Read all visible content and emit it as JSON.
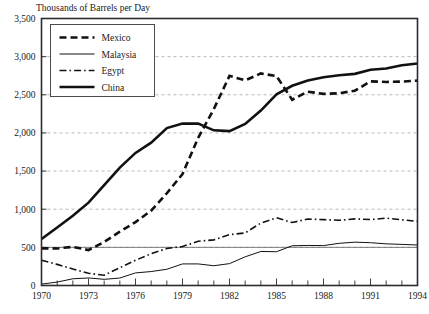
{
  "chart_data": {
    "type": "line",
    "title": "Thousands of Barrels per Day",
    "xlabel": "",
    "ylabel": "",
    "xlim": [
      1970,
      1994
    ],
    "ylim": [
      0,
      3500
    ],
    "ytick_step": 500,
    "ytick_labels": [
      "0",
      "500",
      "1,000",
      "1,500",
      "2,000",
      "2,500",
      "3,000",
      "3,500"
    ],
    "ytick_values": [
      0,
      500,
      1000,
      1500,
      2000,
      2500,
      3000,
      3500
    ],
    "xtick_labels": [
      "1970",
      "1973",
      "1976",
      "1979",
      "1982",
      "1985",
      "1988",
      "1991",
      "1994"
    ],
    "xtick_values": [
      1970,
      1973,
      1976,
      1979,
      1982,
      1985,
      1988,
      1991,
      1994
    ],
    "xminor_step": 1,
    "grid": true,
    "legend_position": "top-left",
    "x": [
      1970,
      1971,
      1972,
      1973,
      1974,
      1975,
      1976,
      1977,
      1978,
      1979,
      1980,
      1981,
      1982,
      1983,
      1984,
      1985,
      1986,
      1987,
      1988,
      1989,
      1990,
      1991,
      1992,
      1993,
      1994
    ],
    "series": [
      {
        "name": "Mexico",
        "style": "dashed",
        "width": 2.6,
        "color": "#111111",
        "values": [
          487,
          486,
          506,
          465,
          571,
          705,
          831,
          981,
          1209,
          1461,
          1936,
          2313,
          2748,
          2689,
          2780,
          2745,
          2435,
          2541,
          2512,
          2520,
          2553,
          2676,
          2668,
          2673,
          2685
        ]
      },
      {
        "name": "Malaysia",
        "style": "solid-thin",
        "width": 1.0,
        "color": "#111111",
        "values": [
          18,
          45,
          88,
          99,
          81,
          98,
          165,
          183,
          213,
          283,
          283,
          259,
          287,
          376,
          446,
          443,
          521,
          525,
          523,
          553,
          568,
          561,
          546,
          539,
          531
        ]
      },
      {
        "name": "Egypt",
        "style": "dashdot",
        "width": 1.6,
        "color": "#111111",
        "values": [
          330,
          277,
          216,
          160,
          135,
          232,
          331,
          417,
          485,
          511,
          580,
          598,
          666,
          689,
          819,
          887,
          826,
          871,
          864,
          855,
          873,
          864,
          883,
          861,
          840
        ]
      },
      {
        "name": "China",
        "style": "solid-thick",
        "width": 2.6,
        "color": "#111111",
        "values": [
          610,
          760,
          914,
          1086,
          1316,
          1545,
          1738,
          1872,
          2063,
          2122,
          2123,
          2034,
          2024,
          2117,
          2293,
          2505,
          2618,
          2688,
          2730,
          2757,
          2774,
          2828,
          2845,
          2887,
          2910
        ]
      }
    ],
    "legend_entries": [
      {
        "label": "Mexico",
        "style": "dashed"
      },
      {
        "label": "Malaysia",
        "style": "solid-thin"
      },
      {
        "label": "Egypt",
        "style": "dashdot"
      },
      {
        "label": "China",
        "style": "solid-thick"
      }
    ]
  }
}
